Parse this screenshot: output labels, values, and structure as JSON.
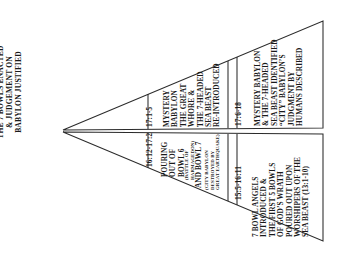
{
  "title": {
    "lines": [
      "The 7 Bowls Enacted",
      "& Judgement on",
      "Babylon Justified"
    ]
  },
  "diagram": {
    "type": "two mirrored horizontal wedge/funnel bands expanding rightward from a shared apex at left",
    "upper_band": {
      "name": "Revelation 17 band",
      "sections": [
        {
          "reference": "17:1-5",
          "lines": [
            "Mystery",
            "Babylon",
            "the Great",
            "Whore &",
            "the 7-Headed",
            "Sea Beast",
            "Re-introduced"
          ]
        },
        {
          "reference": "17:6-18",
          "lines": [
            "Mystery Babylon",
            "& the 7-Headed",
            "Sea Beast Identified",
            "“City” Babylon’s",
            "Judgment by",
            "Humans Described"
          ]
        }
      ]
    },
    "lower_band": {
      "name": "Revelation 15-16 band",
      "sections": [
        {
          "reference": "16:12-17:2",
          "lines_large": [
            "Pouring",
            "Out of",
            "Bowl 6"
          ],
          "lines_small_a": [
            "(Battle of",
            "Harmagedon)"
          ],
          "lines_large_b": [
            "and Bowl 7"
          ],
          "lines_small_b": [
            "(City Babylon",
            "Destroyed by",
            "Great Earthquake)"
          ]
        },
        {
          "reference": "15:5-16:11",
          "lines": [
            "7 Bowl Angels",
            "Introduced &",
            "the First 5 Bowls",
            "of God’s Wrath",
            "Poured Out upon",
            "Worshipers of the",
            "Sea Beast (13:1-10)"
          ]
        }
      ]
    }
  },
  "colors": {
    "ink": "#1a1a1a",
    "background": "#ffffff"
  }
}
